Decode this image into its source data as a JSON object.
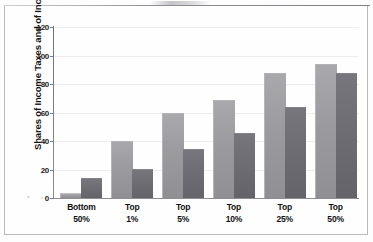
{
  "chart_data": {
    "type": "bar",
    "title": "",
    "xlabel": "",
    "ylabel": "Shares of Income Taxes and of Income (%)",
    "ylim": [
      0,
      120
    ],
    "yticks": [
      0,
      20,
      40,
      60,
      80,
      100,
      120
    ],
    "grid": true,
    "legend": "none",
    "categories": [
      "Bottom\n50%",
      "Top\n1%",
      "Top\n5%",
      "Top\n10%",
      "Top\n25%",
      "Top\n50%"
    ],
    "category_lines": [
      {
        "line1": "Bottom",
        "line2": "50%"
      },
      {
        "line1": "Top",
        "line2": "1%"
      },
      {
        "line1": "Top",
        "line2": "5%"
      },
      {
        "line1": "Top",
        "line2": "10%"
      },
      {
        "line1": "Top",
        "line2": "25%"
      },
      {
        "line1": "Top",
        "line2": "50%"
      }
    ],
    "series": [
      {
        "name": "Share of income taxes",
        "color": "#9b9b9f",
        "values": [
          3,
          39,
          59,
          68,
          87,
          93
        ]
      },
      {
        "name": "Share of income",
        "color": "#6d6d73",
        "values": [
          13,
          20,
          34,
          45,
          63,
          87
        ]
      }
    ]
  },
  "axis": {
    "y_title": "Shares of Income Taxes and of Income (%)",
    "y_tick_labels": [
      "0",
      "20",
      "40",
      "60",
      "80",
      "100",
      "120"
    ]
  }
}
